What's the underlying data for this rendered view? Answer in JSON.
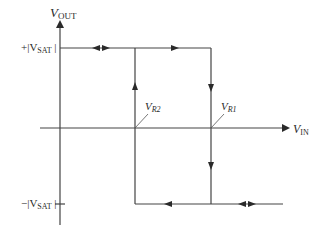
{
  "diagram": {
    "type": "hysteresis-transfer-characteristic",
    "y_axis": {
      "label_main": "V",
      "label_sub": "OUT"
    },
    "x_axis": {
      "label_main": "V",
      "label_sub": "IN"
    },
    "levels": {
      "positive": {
        "prefix": "+|V",
        "sub": "SAT",
        "suffix": " |"
      },
      "negative": {
        "prefix": "−|V",
        "sub": "SAT",
        "suffix": " |"
      }
    },
    "thresholds": [
      {
        "main": "V",
        "sub": "R2",
        "position": "lower"
      },
      {
        "main": "V",
        "sub": "R1",
        "position": "upper"
      }
    ],
    "line_color": "#3a3a3a"
  }
}
